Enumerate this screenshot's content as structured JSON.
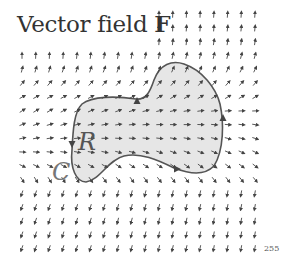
{
  "title": {
    "prefix": "Vector field ",
    "bold": "F"
  },
  "labels": {
    "region": "R",
    "curve": "C"
  },
  "page_number": "255",
  "colors": {
    "region_fill": "#e6e6e6",
    "curve_stroke": "#555555",
    "arrow": "#444444",
    "text": "#333333"
  },
  "diagram": {
    "type": "vector-field-with-region",
    "grid": {
      "cols": 18,
      "x0": 22,
      "dx": 13.7,
      "rows": 18,
      "y0": 15,
      "dy": 13.7
    },
    "orientation_arrows": [
      {
        "x": 137,
        "y": 101,
        "dir": "up"
      },
      {
        "x": 223,
        "y": 118,
        "dir": "up"
      },
      {
        "x": 72,
        "y": 144,
        "dir": "down"
      },
      {
        "x": 177,
        "y": 169,
        "dir": "right"
      }
    ]
  }
}
